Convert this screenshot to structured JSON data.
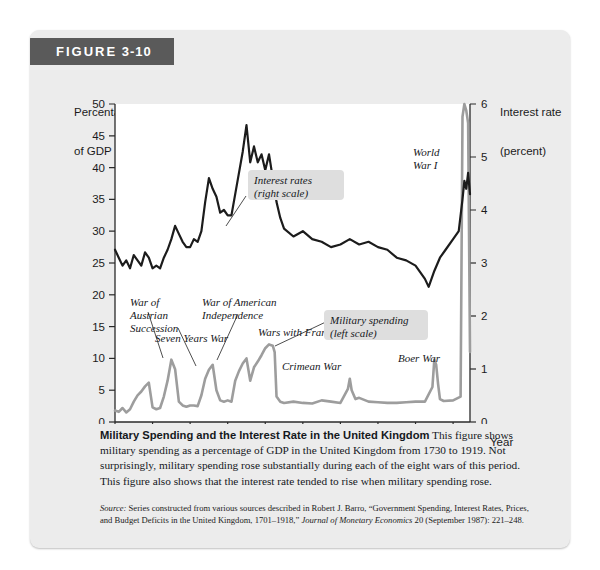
{
  "figure": {
    "label_word": "FIGURE",
    "label_number": "3-10"
  },
  "axes": {
    "y_left_title_line1": "Percentage",
    "y_left_title_line2": "of GDP",
    "y_right_title_line1": "Interest rate",
    "y_right_title_line2": "(percent)",
    "x_title": "Year"
  },
  "annotations": [
    {
      "id": "war-austrian-succession",
      "text": "War of\nAustrian\nSuccession",
      "boxed": false
    },
    {
      "id": "seven-years-war",
      "text": "Seven Years War",
      "boxed": false
    },
    {
      "id": "war-american-independence",
      "text": "War of American\nIndependence",
      "boxed": false
    },
    {
      "id": "wars-with-france",
      "text": "Wars with France",
      "boxed": false
    },
    {
      "id": "crimean-war",
      "text": "Crimean War",
      "boxed": false
    },
    {
      "id": "boer-war",
      "text": "Boer War",
      "boxed": false
    },
    {
      "id": "world-war-i",
      "text": "World\nWar I",
      "boxed": false
    },
    {
      "id": "interest-rates-legend",
      "text": "Interest rates\n(right scale)",
      "boxed": true
    },
    {
      "id": "military-spending-legend",
      "text": "Military spending\n(left scale)",
      "boxed": true
    }
  ],
  "caption": {
    "lead": "Military Spending and the Interest Rate in the United Kingdom",
    "body": "This figure shows military spending as a percentage of GDP in the United Kingdom from 1730 to 1919. Not surprisingly, military spending rose substantially during each of the eight wars of this period. This figure also shows that the interest rate tended to rise when military spending rose."
  },
  "source": {
    "word": "Source:",
    "text_1": " Series constructed from various sources described in Robert J. Barro, “Government Spending, Interest Rates, Prices, and Budget Deficits in the United Kingdom, 1701–1918,” ",
    "journal": "Journal of Monetary Economics",
    "text_2": " 20 (September 1987): 221–248."
  },
  "colors": {
    "badge_bg": "#5a5a5a",
    "card_bg": "#ececec",
    "interest_line": "#1c1c1c",
    "military_line": "#9d9d9d",
    "legend_box_bg": "#dedede",
    "axis": "#2a2a2a"
  },
  "chart_data": {
    "type": "line",
    "title": "Military Spending and the Interest Rate in the United Kingdom",
    "xlabel": "Year",
    "ylabel": "Percentage of GDP",
    "ylabel_right": "Interest rate (percent)",
    "xlim": [
      1730,
      1919
    ],
    "ylim": [
      0,
      50
    ],
    "ylim_right": [
      0,
      6
    ],
    "xticks": [
      1730,
      1750,
      1770,
      1790,
      1810,
      1830,
      1850,
      1870,
      1890,
      1910
    ],
    "yticks_left": [
      0,
      5,
      10,
      15,
      20,
      25,
      30,
      35,
      40,
      45,
      50
    ],
    "yticks_right": [
      0,
      1,
      2,
      3,
      4,
      5,
      6
    ],
    "grid": false,
    "legend_position": "inline-annotation",
    "series": [
      {
        "name": "Military spending (left scale)",
        "axis": "left",
        "color": "#9d9d9d",
        "x": [
          1730,
          1732,
          1734,
          1736,
          1738,
          1740,
          1742,
          1744,
          1746,
          1748,
          1750,
          1752,
          1754,
          1756,
          1758,
          1760,
          1762,
          1764,
          1766,
          1768,
          1770,
          1772,
          1774,
          1776,
          1778,
          1780,
          1782,
          1784,
          1786,
          1788,
          1790,
          1792,
          1794,
          1796,
          1798,
          1800,
          1802,
          1804,
          1806,
          1808,
          1810,
          1812,
          1814,
          1815,
          1816,
          1818,
          1820,
          1825,
          1830,
          1835,
          1840,
          1845,
          1850,
          1854,
          1855,
          1856,
          1858,
          1860,
          1865,
          1870,
          1875,
          1880,
          1885,
          1890,
          1895,
          1899,
          1900,
          1901,
          1902,
          1903,
          1905,
          1910,
          1914,
          1915,
          1916,
          1917,
          1918,
          1919
        ],
        "y": [
          1.8,
          1.6,
          2.2,
          1.5,
          2.0,
          3.2,
          4.2,
          4.8,
          5.6,
          6.2,
          2.3,
          2.0,
          2.2,
          4.0,
          6.5,
          9.8,
          8.3,
          3.2,
          2.6,
          2.4,
          2.6,
          2.6,
          2.5,
          4.2,
          6.8,
          8.2,
          9.0,
          5.0,
          3.4,
          3.2,
          3.4,
          3.2,
          6.5,
          8.0,
          9.2,
          10.0,
          6.5,
          8.6,
          9.5,
          10.5,
          11.6,
          12.2,
          12.0,
          11.0,
          4.0,
          3.2,
          3.0,
          3.2,
          3.0,
          2.9,
          3.4,
          3.2,
          3.0,
          5.2,
          6.8,
          5.0,
          3.6,
          3.8,
          3.2,
          3.1,
          3.0,
          3.0,
          3.1,
          3.2,
          3.2,
          5.5,
          9.8,
          9.0,
          6.0,
          3.6,
          3.3,
          3.4,
          4.0,
          48.0,
          50.0,
          49.0,
          47.0,
          11.0
        ]
      },
      {
        "name": "Interest rates (right scale)",
        "axis": "right",
        "color": "#1c1c1c",
        "x": [
          1730,
          1732,
          1734,
          1736,
          1738,
          1740,
          1742,
          1744,
          1746,
          1748,
          1750,
          1752,
          1754,
          1756,
          1758,
          1760,
          1762,
          1764,
          1766,
          1768,
          1770,
          1772,
          1774,
          1776,
          1778,
          1780,
          1782,
          1784,
          1786,
          1788,
          1790,
          1792,
          1794,
          1796,
          1798,
          1800,
          1802,
          1804,
          1806,
          1808,
          1810,
          1812,
          1814,
          1816,
          1818,
          1820,
          1825,
          1830,
          1835,
          1840,
          1845,
          1850,
          1855,
          1860,
          1865,
          1870,
          1875,
          1880,
          1885,
          1890,
          1895,
          1897,
          1900,
          1903,
          1906,
          1910,
          1913,
          1915,
          1916,
          1917,
          1918,
          1919
        ],
        "y": [
          3.25,
          3.1,
          2.95,
          3.05,
          2.9,
          3.15,
          3.05,
          2.95,
          3.2,
          3.1,
          2.9,
          2.95,
          2.9,
          3.1,
          3.25,
          3.45,
          3.7,
          3.55,
          3.4,
          3.3,
          3.3,
          3.45,
          3.4,
          3.6,
          4.15,
          4.6,
          4.4,
          4.25,
          3.95,
          4.0,
          3.9,
          3.9,
          4.3,
          4.7,
          5.1,
          5.6,
          4.9,
          5.2,
          4.9,
          5.05,
          4.75,
          5.05,
          4.6,
          4.15,
          3.85,
          3.65,
          3.5,
          3.6,
          3.45,
          3.4,
          3.3,
          3.35,
          3.45,
          3.35,
          3.4,
          3.3,
          3.25,
          3.1,
          3.05,
          2.95,
          2.7,
          2.55,
          2.85,
          3.1,
          3.25,
          3.45,
          3.6,
          4.2,
          4.55,
          4.4,
          4.7,
          4.3
        ]
      }
    ],
    "annotations": [
      {
        "label": "War of Austrian Succession",
        "year": 1748,
        "series": "military"
      },
      {
        "label": "Seven Years War",
        "year": 1760,
        "series": "military"
      },
      {
        "label": "War of American Independence",
        "year": 1782,
        "series": "military"
      },
      {
        "label": "Wars with France",
        "year": 1800,
        "series": "military"
      },
      {
        "label": "Crimean War",
        "year": 1855,
        "series": "military"
      },
      {
        "label": "Boer War",
        "year": 1900,
        "series": "military"
      },
      {
        "label": "World War I",
        "year": 1916,
        "series": "military"
      }
    ]
  }
}
